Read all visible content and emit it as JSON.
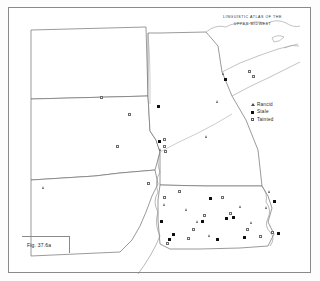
{
  "title": {
    "line1": "LINGUISTIC ATLAS OF THE",
    "line2": "UPPER MIDWEST"
  },
  "figure": {
    "caption": "Fig. 37.6a"
  },
  "legend": {
    "items": [
      {
        "symbol": "triangle",
        "label": "Rancid"
      },
      {
        "symbol": "filled-square",
        "label": "Stale"
      },
      {
        "symbol": "open-square",
        "label": "Tainted"
      }
    ]
  },
  "colors": {
    "frame": "#8a8a8a",
    "state_border": "#6e6e6e",
    "coastline": "#9a9a9a",
    "filled_symbol": "#0d0d0d",
    "open_symbol": "#6b6b6b",
    "triangle_symbol": "#616161",
    "background": "#ffffff"
  },
  "map_data": {
    "type": "point-distribution",
    "region": "Upper Midwest, United States",
    "states": [
      "North Dakota",
      "South Dakota",
      "Nebraska",
      "Minnesota",
      "Iowa"
    ],
    "series": [
      {
        "name": "Rancid",
        "symbol": "triangle",
        "count": 12
      },
      {
        "name": "Stale",
        "symbol": "filled-square",
        "count": 16
      },
      {
        "name": "Tainted",
        "symbol": "open-square",
        "count": 19
      }
    ],
    "points": [
      {
        "symbol": "open-square",
        "x": 128,
        "y": 113
      },
      {
        "symbol": "open-square",
        "x": 116,
        "y": 145
      },
      {
        "symbol": "filled-square",
        "x": 157,
        "y": 105
      },
      {
        "symbol": "filled-square",
        "x": 158,
        "y": 140
      },
      {
        "symbol": "open-square",
        "x": 163,
        "y": 138
      },
      {
        "symbol": "open-square",
        "x": 163,
        "y": 145
      },
      {
        "symbol": "triangle",
        "x": 159,
        "y": 148
      },
      {
        "symbol": "open-square",
        "x": 164,
        "y": 150
      },
      {
        "symbol": "triangle",
        "x": 42,
        "y": 186
      },
      {
        "symbol": "open-square",
        "x": 100,
        "y": 96
      },
      {
        "symbol": "triangle",
        "x": 205,
        "y": 135
      },
      {
        "symbol": "triangle",
        "x": 222,
        "y": 72
      },
      {
        "symbol": "filled-square",
        "x": 224,
        "y": 78
      },
      {
        "symbol": "open-square",
        "x": 248,
        "y": 70
      },
      {
        "symbol": "open-square",
        "x": 252,
        "y": 75
      },
      {
        "symbol": "triangle",
        "x": 216,
        "y": 100
      },
      {
        "symbol": "open-square",
        "x": 163,
        "y": 196
      },
      {
        "symbol": "triangle",
        "x": 163,
        "y": 203
      },
      {
        "symbol": "open-square",
        "x": 178,
        "y": 190
      },
      {
        "symbol": "triangle",
        "x": 196,
        "y": 220
      },
      {
        "symbol": "filled-square",
        "x": 201,
        "y": 220
      },
      {
        "symbol": "open-square",
        "x": 203,
        "y": 214
      },
      {
        "symbol": "filled-square",
        "x": 225,
        "y": 217
      },
      {
        "symbol": "open-square",
        "x": 229,
        "y": 212
      },
      {
        "symbol": "triangle",
        "x": 239,
        "y": 205
      },
      {
        "symbol": "open-square",
        "x": 221,
        "y": 196
      },
      {
        "symbol": "filled-square",
        "x": 232,
        "y": 216
      },
      {
        "symbol": "triangle",
        "x": 265,
        "y": 206
      },
      {
        "symbol": "filled-square",
        "x": 273,
        "y": 200
      },
      {
        "symbol": "open-square",
        "x": 271,
        "y": 231
      },
      {
        "symbol": "filled-square",
        "x": 277,
        "y": 232
      },
      {
        "symbol": "open-square",
        "x": 259,
        "y": 235
      },
      {
        "symbol": "filled-square",
        "x": 216,
        "y": 238
      },
      {
        "symbol": "triangle",
        "x": 208,
        "y": 234
      },
      {
        "symbol": "open-square",
        "x": 187,
        "y": 237
      },
      {
        "symbol": "filled-square",
        "x": 172,
        "y": 233
      },
      {
        "symbol": "filled-square",
        "x": 168,
        "y": 238
      },
      {
        "symbol": "open-square",
        "x": 166,
        "y": 242
      },
      {
        "symbol": "triangle",
        "x": 185,
        "y": 208
      },
      {
        "symbol": "filled-square",
        "x": 209,
        "y": 197
      },
      {
        "symbol": "open-square",
        "x": 246,
        "y": 228
      },
      {
        "symbol": "triangle",
        "x": 250,
        "y": 221
      },
      {
        "symbol": "filled-square",
        "x": 160,
        "y": 220
      },
      {
        "symbol": "open-square",
        "x": 192,
        "y": 228
      },
      {
        "symbol": "filled-square",
        "x": 243,
        "y": 236
      },
      {
        "symbol": "triangle",
        "x": 268,
        "y": 190
      },
      {
        "symbol": "open-square",
        "x": 147,
        "y": 182
      }
    ]
  }
}
